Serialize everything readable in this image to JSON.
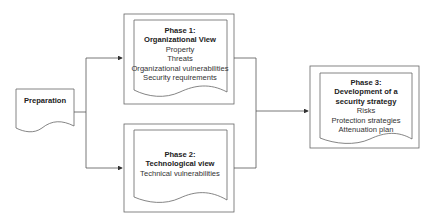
{
  "diagram": {
    "colors": {
      "stroke": "#555555",
      "background": "#ffffff",
      "text": "#222222"
    },
    "nodes": {
      "preparation": {
        "title": "Preparation"
      },
      "phase1": {
        "title_line1": "Phase 1:",
        "title_line2": "Organizational View",
        "items": [
          "Property",
          "Threats",
          "Organizational vulnerabilities",
          "Security requirements"
        ]
      },
      "phase2": {
        "title_line1": "Phase 2:",
        "title_line2": "Technological view",
        "items": [
          "Technical vulnerabilities"
        ]
      },
      "phase3": {
        "title_line1": "Phase 3:",
        "title_line2": "Development of a",
        "title_line3": "security strategy",
        "items": [
          "Risks",
          "Protection strategies",
          "Attenuation plan"
        ]
      }
    },
    "edges": [
      {
        "from": "preparation",
        "to": "phase1"
      },
      {
        "from": "preparation",
        "to": "phase2"
      },
      {
        "from": "phase1",
        "to": "phase3"
      },
      {
        "from": "phase2",
        "to": "phase3"
      }
    ]
  }
}
